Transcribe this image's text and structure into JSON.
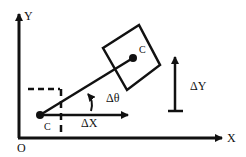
{
  "diagram": {
    "labels": {
      "y_axis": "Y",
      "x_axis": "X",
      "origin": "O",
      "point_lower": "C",
      "point_upper": "C",
      "delta_x": "ΔX",
      "delta_y": "ΔY",
      "delta_theta": "Δθ"
    },
    "colors": {
      "stroke": "#111111",
      "background": "#ffffff"
    }
  }
}
